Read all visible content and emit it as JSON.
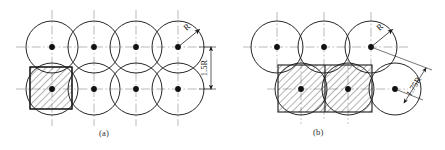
{
  "figure": {
    "type": "technical-diagram",
    "background_color": "#ffffff",
    "line_color": "#1a1a1a",
    "centerline_color": "#8c8c8c",
    "hatch_color": "#2b2b2b",
    "panels": [
      {
        "id": "a",
        "caption": "(a)",
        "pattern": "square-grid",
        "rows": 2,
        "columns": 4,
        "circle_radius": 26,
        "center_spacing": 42,
        "spacing_label": "1.5R",
        "spacing_label_rotated": true,
        "radius_label": "R",
        "radius_label_circle_index": 3,
        "hatched_region": {
          "shape": "square",
          "description": "unit cell bounded by four adjacent circle centers",
          "x": 30,
          "y": 67,
          "width": 42,
          "height": 42
        },
        "centers_row_top": [
          52,
          94,
          136,
          178
        ],
        "centers_row_bottom": [
          52,
          94,
          136,
          178
        ],
        "row_top_y": 47,
        "row_bottom_y": 89
      },
      {
        "id": "b",
        "caption": "(b)",
        "pattern": "staggered-offset",
        "rows": 2,
        "columns_top": 3,
        "columns_bottom": 2,
        "circle_radius": 26,
        "center_spacing": 47,
        "spacing_label": "1.75R",
        "spacing_label_rotated": true,
        "radius_label": "R",
        "radius_label_circle_index": 2,
        "hatched_region": {
          "shape": "square",
          "description": "unit cell bounded by staggered circle centers",
          "x": 278,
          "y": 65,
          "width": 47,
          "height": 47
        },
        "centers_row_top": [
          277,
          324,
          371
        ],
        "centers_row_bottom": [
          301,
          348
        ],
        "row_top_y": 47,
        "row_bottom_y": 89
      }
    ],
    "labels": {
      "radius": "R",
      "spacing_a": "1.5R",
      "spacing_b": "1.75R",
      "caption_a": "(a)",
      "caption_b": "(b)"
    },
    "bottom_bleed_text": ""
  }
}
